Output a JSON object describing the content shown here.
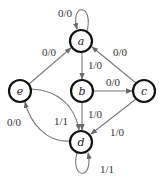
{
  "diagram": {
    "type": "finite-state-machine",
    "colors": {
      "node_stroke": "#111111",
      "edge_stroke": "#7a7a7a",
      "text": "#333333",
      "background": "#ffffff"
    },
    "nodes": [
      {
        "id": "a",
        "label": "a",
        "x": 81,
        "y": 41
      },
      {
        "id": "b",
        "label": "b",
        "x": 82,
        "y": 91
      },
      {
        "id": "c",
        "label": "c",
        "x": 144,
        "y": 91
      },
      {
        "id": "d",
        "label": "d",
        "x": 81,
        "y": 142
      },
      {
        "id": "e",
        "label": "e",
        "x": 20,
        "y": 91
      }
    ],
    "edges": [
      {
        "from": "a",
        "to": "a",
        "label": "0/0"
      },
      {
        "from": "e",
        "to": "a",
        "label": "0/0"
      },
      {
        "from": "c",
        "to": "a",
        "label": "0/0"
      },
      {
        "from": "a",
        "to": "b",
        "label": "1/0"
      },
      {
        "from": "b",
        "to": "c",
        "label": "0/0"
      },
      {
        "from": "b",
        "to": "d",
        "label": "1/0"
      },
      {
        "from": "c",
        "to": "d",
        "label": "1/0"
      },
      {
        "from": "e",
        "to": "d",
        "label": "1/1"
      },
      {
        "from": "d",
        "to": "e",
        "label": "0/0"
      },
      {
        "from": "d",
        "to": "d",
        "label": "1/1"
      }
    ]
  }
}
